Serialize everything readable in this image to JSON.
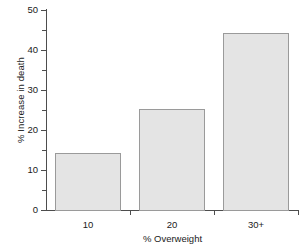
{
  "chart_data": {
    "type": "bar",
    "title": "",
    "subtitle": "",
    "xlabel": "% Overweight",
    "ylabel": "% Increase in death",
    "categories": [
      "10",
      "20",
      "30+"
    ],
    "values": [
      14.25,
      25.2,
      44.2
    ],
    "series": [
      {
        "name": "% Increase in death",
        "values": [
          14.25,
          25.2,
          44.2
        ]
      }
    ],
    "ylim": [
      0,
      50
    ],
    "y_ticks_major": [
      0,
      10,
      20,
      30,
      40,
      50
    ],
    "y_tick_labels": [
      "0",
      "10",
      "20",
      "30",
      "40",
      "50"
    ],
    "y_ticks_minor": [
      5,
      15,
      25,
      35,
      45
    ],
    "grid": false,
    "legend": false,
    "legend_position": "none",
    "bar_fill_color": "#e4e4e4",
    "bar_border_color": "#9a9a9a",
    "axis_color": "#4d4d4d",
    "background_color": "#ffffff"
  },
  "axes": {
    "y_title": "% Increase in death",
    "x_title": "% Overweight"
  }
}
